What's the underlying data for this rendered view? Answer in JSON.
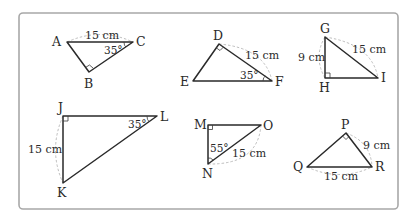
{
  "figure": {
    "frame": {
      "border_color": "#a8a8a8",
      "background": "#ffffff"
    },
    "triangles": [
      {
        "name": "ABC",
        "vertices": {
          "A": "A",
          "B": "B",
          "C": "C"
        },
        "right_angle_at": "B",
        "side_label": "15 cm",
        "side_labeled": "AC",
        "angle_label": "35°",
        "angle_at": "C"
      },
      {
        "name": "DEF",
        "vertices": {
          "D": "D",
          "E": "E",
          "F": "F"
        },
        "right_angle_at": "D",
        "side_label": "15 cm",
        "side_labeled": "DF",
        "angle_label": "35°",
        "angle_at": "F"
      },
      {
        "name": "GHI",
        "vertices": {
          "G": "G",
          "H": "H",
          "I": "I"
        },
        "right_angle_at": "H",
        "side_labels": [
          "9 cm",
          "15 cm"
        ],
        "sides_labeled": [
          "GH",
          "GI"
        ]
      },
      {
        "name": "JKL",
        "vertices": {
          "J": "J",
          "K": "K",
          "L": "L"
        },
        "right_angle_at": "J",
        "side_label": "15 cm",
        "side_labeled": "JK",
        "angle_label": "35°",
        "angle_at": "L"
      },
      {
        "name": "MNO",
        "vertices": {
          "M": "M",
          "N": "N",
          "O": "O"
        },
        "right_angle_at": "M",
        "side_label": "15 cm",
        "side_labeled": "NO",
        "angle_label": "55°",
        "angle_at": "N"
      },
      {
        "name": "PQR",
        "vertices": {
          "P": "P",
          "Q": "Q",
          "R": "R"
        },
        "right_angle_at": "P",
        "side_labels": [
          "9 cm",
          "15 cm"
        ],
        "sides_labeled": [
          "PR",
          "QR"
        ]
      }
    ]
  }
}
